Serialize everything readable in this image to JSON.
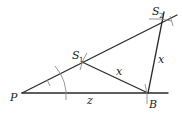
{
  "diagram": {
    "type": "geometric-construction",
    "points": {
      "P": {
        "label": "P",
        "x": 22,
        "y": 93
      },
      "S1": {
        "label": "S",
        "sub": "1",
        "x": 82,
        "y": 62
      },
      "S2": {
        "label": "S",
        "sub": "2",
        "x": 162,
        "y": 22
      },
      "B": {
        "label": "B",
        "x": 148,
        "y": 93
      }
    },
    "segments": [
      {
        "from": "P",
        "to": "B",
        "label": "z"
      },
      {
        "from": "S1",
        "to": "B",
        "label": "x"
      },
      {
        "from": "B",
        "to": "S2",
        "label": "x"
      },
      {
        "from": "P",
        "to": "S2",
        "label": ""
      }
    ],
    "labels": {
      "P": "P",
      "S1_main": "S",
      "S1_sub": "1",
      "S2_main": "S",
      "S2_sub": "2",
      "B": "B",
      "z": "z",
      "x_lower": "x",
      "x_right": "x"
    },
    "colors": {
      "line": "#2a2a2a",
      "arc": "#8a8a8a",
      "text": "#222222"
    }
  }
}
